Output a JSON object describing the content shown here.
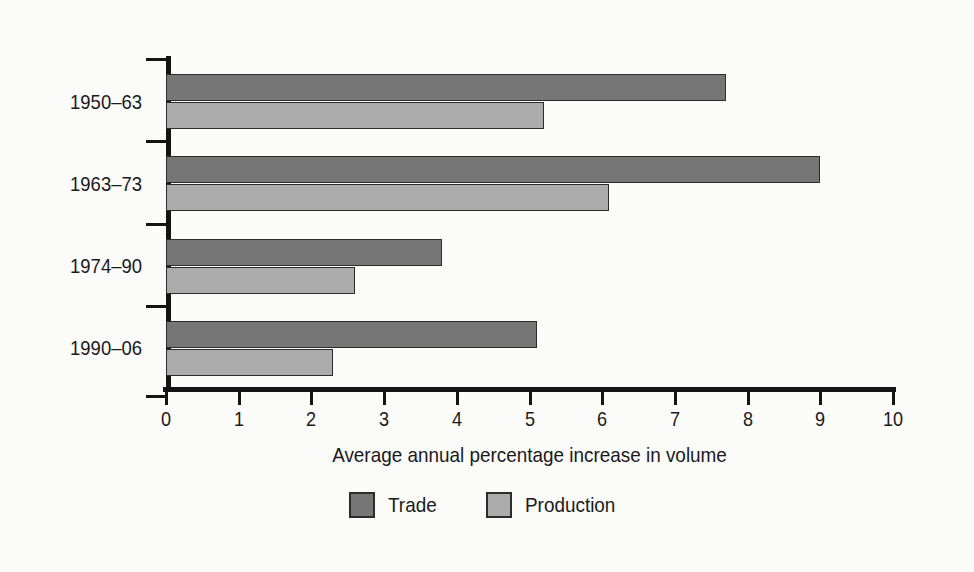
{
  "chart_data": {
    "type": "bar",
    "orientation": "horizontal",
    "title": "",
    "xlabel": "Average annual percentage increase in volume",
    "ylabel": "",
    "xlim": [
      0,
      10
    ],
    "xticks": [
      "0",
      "1",
      "2",
      "3",
      "4",
      "5",
      "6",
      "7",
      "8",
      "9",
      "10"
    ],
    "grid": false,
    "legend_position": "bottom-center",
    "categories": [
      "1950–63",
      "1963–73",
      "1974–90",
      "1990–06"
    ],
    "series": [
      {
        "name": "Trade",
        "color": "#767676",
        "values": [
          7.7,
          9.0,
          3.8,
          5.1
        ]
      },
      {
        "name": "Production",
        "color": "#ababab",
        "values": [
          5.2,
          6.1,
          2.6,
          2.3
        ]
      }
    ]
  },
  "legend": {
    "items": [
      {
        "label": "Trade",
        "swatch": "trade-swatch"
      },
      {
        "label": "Production",
        "swatch": "production-swatch"
      }
    ]
  },
  "colors": {
    "trade": "#767676",
    "production": "#ababab",
    "axis": "#141414",
    "background": "#fbfbfa",
    "text": "#1a1a1a"
  }
}
